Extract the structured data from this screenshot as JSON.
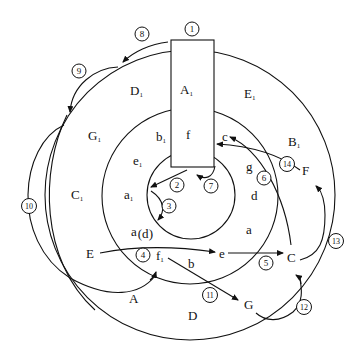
{
  "diagram": {
    "type": "concentric-circle region diagram with numbered transition arrows",
    "colors": {
      "stroke": "#111111",
      "background": "#ffffff"
    },
    "circles": [
      {
        "name": "outer",
        "cx": 190,
        "cy": 195,
        "r": 145
      },
      {
        "name": "middle",
        "cx": 190,
        "cy": 196,
        "r": 88
      },
      {
        "name": "inner",
        "cx": 191,
        "cy": 195,
        "r": 44
      }
    ],
    "rectangle": {
      "x": 171,
      "y": 40,
      "width": 43,
      "height": 127
    },
    "region_labels": [
      {
        "text": "A",
        "sub": "1",
        "x": 186,
        "y": 90
      },
      {
        "text": "f",
        "x": 188,
        "y": 135
      },
      {
        "text": "D",
        "sub": "1",
        "x": 131,
        "y": 95
      },
      {
        "text": "E",
        "sub": "1",
        "x": 245,
        "y": 97
      },
      {
        "text": "G",
        "sub": "1",
        "x": 88,
        "y": 142
      },
      {
        "text": "b",
        "sub": "1",
        "x": 156,
        "y": 142
      },
      {
        "text": "B",
        "sub": "1",
        "x": 288,
        "y": 148
      },
      {
        "text": "e",
        "sub": "1",
        "x": 134,
        "y": 166
      },
      {
        "text": "c",
        "x": 221,
        "y": 141
      },
      {
        "text": "g",
        "x": 246,
        "y": 170
      },
      {
        "text": "C",
        "sub": "1",
        "x": 72,
        "y": 200
      },
      {
        "text": "a",
        "sub": "1",
        "x": 125,
        "y": 200
      },
      {
        "text": "d",
        "x": 250,
        "y": 198
      },
      {
        "text": "a",
        "x": 245,
        "y": 233
      },
      {
        "text": "a",
        "sub": "(d",
        "suffix": ")",
        "x": 132,
        "y": 236
      },
      {
        "text": "E",
        "x": 89,
        "y": 257
      },
      {
        "text": "f",
        "sub": "1",
        "x": 156,
        "y": 261
      },
      {
        "text": "e",
        "x": 219,
        "y": 257
      },
      {
        "text": "C",
        "x": 288,
        "y": 262
      },
      {
        "text": "b",
        "x": 188,
        "y": 268
      },
      {
        "text": "F",
        "x": 301,
        "y": 172
      },
      {
        "text": "A",
        "x": 129,
        "y": 302
      },
      {
        "text": "G",
        "x": 244,
        "y": 308
      },
      {
        "text": "D",
        "x": 188,
        "y": 319
      }
    ],
    "numbered_markers": [
      {
        "n": "1",
        "x": 192,
        "y": 29
      },
      {
        "n": "2",
        "x": 176,
        "y": 185
      },
      {
        "n": "3",
        "x": 170,
        "y": 205
      },
      {
        "n": "4",
        "x": 142,
        "y": 256
      },
      {
        "n": "5",
        "x": 266,
        "y": 262
      },
      {
        "n": "6",
        "x": 263,
        "y": 178
      },
      {
        "n": "7",
        "x": 211,
        "y": 186
      },
      {
        "n": "8",
        "x": 143,
        "y": 34
      },
      {
        "n": "9",
        "x": 79,
        "y": 70
      },
      {
        "n": "10",
        "x": 29,
        "y": 206
      },
      {
        "n": "11",
        "x": 210,
        "y": 294
      },
      {
        "n": "12",
        "x": 303,
        "y": 307
      },
      {
        "n": "13",
        "x": 336,
        "y": 241
      },
      {
        "n": "14",
        "x": 287,
        "y": 164
      }
    ]
  }
}
